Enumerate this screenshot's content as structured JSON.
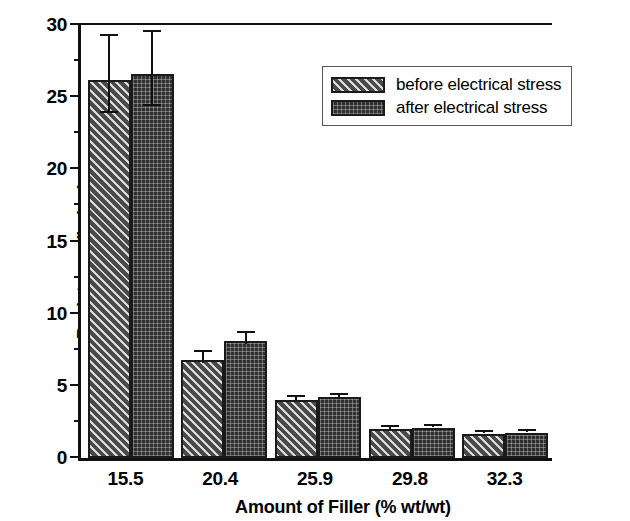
{
  "chart_data": {
    "type": "bar",
    "title": "",
    "xlabel": "Amount of Filler (% wt/wt)",
    "ylabel": "Resistance (kohm)",
    "categories": [
      "15.5",
      "20.4",
      "25.9",
      "29.8",
      "32.3"
    ],
    "series": [
      {
        "name": "before electrical stress",
        "pattern": "diagonal-hatch",
        "color": "#4a4a4a",
        "values": [
          26.2,
          6.8,
          4.0,
          2.0,
          1.65
        ],
        "errors": [
          2.7,
          0.45,
          0.15,
          0.15,
          0.1
        ]
      },
      {
        "name": "after electrical stress",
        "pattern": "cross-hatch",
        "color": "#303030",
        "values": [
          26.6,
          8.1,
          4.2,
          2.1,
          1.75
        ],
        "errors": [
          2.6,
          0.45,
          0.15,
          0.12,
          0.1
        ]
      }
    ],
    "ylim": [
      0,
      30
    ],
    "y_major_ticks": [
      0,
      5,
      10,
      15,
      20,
      25,
      30
    ],
    "y_minor_ticks": [
      2.5,
      7.5,
      12.5,
      17.5,
      22.5,
      27.5
    ],
    "y_tick_labels": [
      "0",
      "5",
      "10",
      "15",
      "20",
      "25",
      "30"
    ],
    "grid": false,
    "legend_position": "top-right",
    "error_bars": true
  },
  "legend": {
    "items": [
      {
        "label": "before electrical stress"
      },
      {
        "label": "after electrical stress"
      }
    ]
  }
}
